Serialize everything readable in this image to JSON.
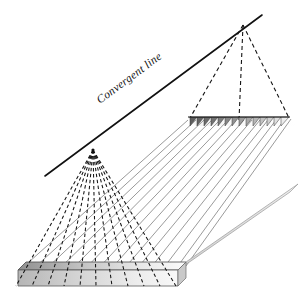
{
  "figure": {
    "title_label": "Convergent line",
    "labels": {
      "convergent_line": "Convergent line"
    },
    "colors": {
      "stroke_dark": "#111111",
      "stroke_ray_solid": "#8a8a8a",
      "stroke_ray_dashed": "#1a1a1a",
      "slab_dark": "#8f8f8f",
      "slab_light": "#fbfbfb",
      "slab_side": "#d6d6d6",
      "triangle_dark": "#6f6f6f",
      "triangle_light": "#e8e8e8",
      "background": "#ffffff"
    },
    "geometry": {
      "convergent_line_start": [
        45,
        176
      ],
      "convergent_line_end": [
        262,
        15
      ],
      "left_focus_point": [
        93,
        150
      ],
      "right_apex_point": [
        243,
        25
      ],
      "near_slab_top_left": [
        18,
        270
      ],
      "near_slab_top_right": [
        178,
        270
      ],
      "near_slab_bottom_left": [
        18,
        284
      ],
      "near_slab_bottom_right": [
        178,
        284
      ],
      "far_strip_left": [
        188,
        118
      ],
      "far_strip_right": [
        290,
        118
      ],
      "far_strip_count": 14,
      "dashed_fan_count": 11,
      "solid_ray_count": 13
    }
  }
}
